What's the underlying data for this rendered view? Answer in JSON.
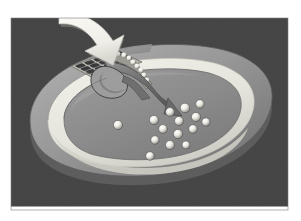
{
  "figure": {
    "title": "Cut-away cross-section of a rounded capsule-shaped body",
    "style": "grayscale halftone scientific illustration",
    "frame": {
      "border_color": "#ffffff",
      "panel_color": "#4b4b4b",
      "panel_x": 11,
      "panel_y": 18,
      "panel_width": 277,
      "panel_height": 192
    },
    "colors": {
      "background": "#4b4b4b",
      "background_dark": "#3f3f3f",
      "outer_wall": "#9a9a9a",
      "outer_wall_shadow": "#6e6e6e",
      "outer_wall_highlight": "#b4b4b4",
      "lumen_ring": "#ecebe4",
      "lumen_ring_shade": "#d6d5cd",
      "interior": "#8c8c8c",
      "interior_shade": "#7a7a7a",
      "arrow": "#f4f3ee",
      "arrow_shadow": "#bdbcb6",
      "grid_plate": "#b9b8b0",
      "grid_cell": "#3a3a3a",
      "chute": "#6a6a6a",
      "chute_light": "#8f8f8f",
      "particle_light": "#f2f1ea",
      "particle_shadow": "#57575a",
      "outline": "#2b2b2b"
    },
    "elements": [
      {
        "name": "entry-arrow",
        "label": "white curved arrow entering from upper left",
        "direction": "down-right",
        "color": "#f4f3ee"
      },
      {
        "name": "crystal-grid",
        "label": "ordered lattice array of dark cells in the wall",
        "columns": 5,
        "rows": 4,
        "cell_color": "#3a3a3a",
        "plate_color": "#b9b8b0"
      },
      {
        "name": "transition-band",
        "label": "band where ordered lattice cells become loose bright particles",
        "particle_count": 9
      },
      {
        "name": "release-chute",
        "label": "curved channel carrying material into the interior",
        "color": "#6a6a6a"
      },
      {
        "name": "interior-particles",
        "label": "scattered spherical particles dispersed in the interior",
        "count": 15,
        "highlight_color": "#f2f1ea",
        "shadow_color": "#57575a"
      },
      {
        "name": "outer-wall",
        "label": "outer capsule wall, cut open on the top face"
      },
      {
        "name": "lumen-ring",
        "label": "bright ring between outer wall and interior"
      },
      {
        "name": "interior-cavity",
        "label": "inner cavity containing the dispersed particles"
      }
    ],
    "grid_cells": [
      [
        1,
        1,
        1,
        1,
        1
      ],
      [
        1,
        1,
        1,
        1,
        1
      ],
      [
        1,
        1,
        1,
        1,
        1
      ],
      [
        1,
        1,
        1,
        1,
        0
      ]
    ],
    "interior_particles": [
      {
        "cx": 154,
        "cy": 120,
        "r": 4.6
      },
      {
        "cx": 170,
        "cy": 112,
        "r": 4.4
      },
      {
        "cx": 185,
        "cy": 108,
        "r": 4.8
      },
      {
        "cx": 200,
        "cy": 104,
        "r": 4.3
      },
      {
        "cx": 196,
        "cy": 117,
        "r": 4.6
      },
      {
        "cx": 179,
        "cy": 121,
        "r": 4.5
      },
      {
        "cx": 163,
        "cy": 129,
        "r": 4.4
      },
      {
        "cx": 178,
        "cy": 134,
        "r": 4.6
      },
      {
        "cx": 193,
        "cy": 129,
        "r": 4.3
      },
      {
        "cx": 206,
        "cy": 122,
        "r": 4.1
      },
      {
        "cx": 170,
        "cy": 145,
        "r": 4.5
      },
      {
        "cx": 155,
        "cy": 140,
        "r": 4.2
      },
      {
        "cx": 186,
        "cy": 145,
        "r": 4.0
      },
      {
        "cx": 118,
        "cy": 125,
        "r": 4.6
      },
      {
        "cx": 150,
        "cy": 156,
        "r": 4.3
      }
    ],
    "transition_particles": [
      {
        "cx": 112,
        "cy": 56,
        "r": 2.6
      },
      {
        "cx": 118,
        "cy": 54,
        "r": 2.5
      },
      {
        "cx": 124,
        "cy": 55,
        "r": 2.6
      },
      {
        "cx": 129,
        "cy": 58,
        "r": 2.4
      },
      {
        "cx": 133,
        "cy": 62,
        "r": 2.6
      },
      {
        "cx": 137,
        "cy": 66,
        "r": 2.5
      },
      {
        "cx": 141,
        "cy": 70,
        "r": 2.6
      },
      {
        "cx": 144,
        "cy": 75,
        "r": 2.4
      },
      {
        "cx": 147,
        "cy": 80,
        "r": 2.5
      }
    ]
  }
}
